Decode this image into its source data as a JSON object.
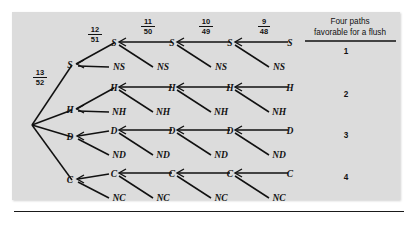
{
  "figure": {
    "type": "probability-tree-diagram",
    "title_block": {
      "line1": "Four paths",
      "line2": "favorable  for a flush"
    },
    "background_color": "#dcdcdc",
    "ink_color": "#111111"
  },
  "branch_probabilities": [
    {
      "id": "p1",
      "numerator": "13",
      "denominator": "52",
      "label": "13/52"
    },
    {
      "id": "p2",
      "numerator": "12",
      "denominator": "51",
      "label": "12/51"
    },
    {
      "id": "p3",
      "numerator": "11",
      "denominator": "50",
      "label": "11/50"
    },
    {
      "id": "p4",
      "numerator": "10",
      "denominator": "49",
      "label": "10/49"
    },
    {
      "id": "p5",
      "numerator": "9",
      "denominator": "48",
      "label": "9/48"
    }
  ],
  "rows": [
    {
      "suit": "S",
      "path_number": "1",
      "hit_labels": [
        "S",
        "S",
        "S",
        "S",
        "S"
      ],
      "miss_labels": [
        "NS",
        "NS",
        "NS",
        "NS"
      ]
    },
    {
      "suit": "H",
      "path_number": "2",
      "hit_labels": [
        "H",
        "H",
        "H",
        "H",
        "H"
      ],
      "miss_labels": [
        "NH",
        "NH",
        "NH",
        "NH"
      ]
    },
    {
      "suit": "D",
      "path_number": "3",
      "hit_labels": [
        "D",
        "D",
        "D",
        "D",
        "D"
      ],
      "miss_labels": [
        "ND",
        "ND",
        "ND",
        "ND"
      ]
    },
    {
      "suit": "C",
      "path_number": "4",
      "hit_labels": [
        "C",
        "C",
        "C",
        "C",
        "C"
      ],
      "miss_labels": [
        "NC",
        "NC",
        "NC",
        "NC"
      ]
    }
  ],
  "path_numbers": [
    "1",
    "2",
    "3",
    "4"
  ]
}
